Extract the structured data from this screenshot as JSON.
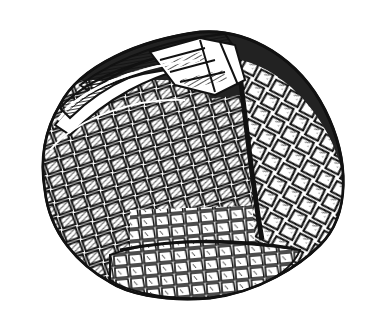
{
  "image": {
    "subject": "armadillo rolled into a ball",
    "style": "black-and-white engraving",
    "background_color": "#ffffff",
    "ink_color": "#111111",
    "width": 380,
    "height": 334
  }
}
